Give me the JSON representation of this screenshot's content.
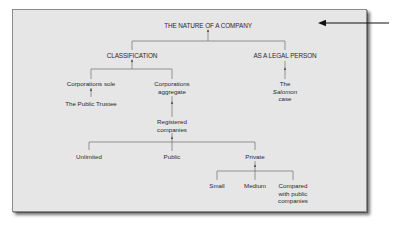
{
  "diagram": {
    "root": "THE NATURE OF A COMPANY",
    "classification": {
      "label": "CLASSIFICATION",
      "corporations_sole": "Corporations sole",
      "public_trustee": "The Public Trustee",
      "corporations_aggregate_line1": "Corporations",
      "corporations_aggregate_line2": "aggregate",
      "registered_line1": "Registered",
      "registered_line2": "companies",
      "unlimited": "Unlimited",
      "public": "Public",
      "private": "Private",
      "small": "Small",
      "medium": "Medium",
      "compared_line1": "Compared",
      "compared_line2": "with public",
      "compared_line3": "companies"
    },
    "legal_person": {
      "label": "AS A LEGAL PERSON",
      "salomon_line1": "The",
      "salomon_line2": "Salomon",
      "salomon_line3": "case"
    }
  },
  "colors": {
    "panel_background": "#e6e6e6",
    "line_color": "#6e6e6e",
    "text_color": "#2a2a2a",
    "arrow_color": "#111111"
  }
}
